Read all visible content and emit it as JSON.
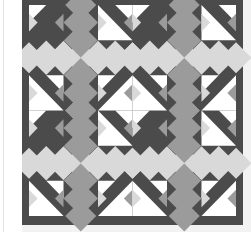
{
  "image": {
    "subject": "quilt-pattern",
    "description": "Geometric quilt with half-square triangles and on-point squares in gray tones"
  },
  "colors": {
    "dark": "#4b4b4b",
    "mid": "#9b9b9b",
    "light": "#d9d9d9",
    "white": "#ffffff",
    "border": "#4b4b4b",
    "binding": "#f2f2f2",
    "background": "#ffffff"
  },
  "quilt": {
    "x": 0,
    "y": 0,
    "outer_w": 221,
    "outer_h": 225,
    "border": 7,
    "grid_cols": 12,
    "grid_rows": 12,
    "block": [
      [
        "wl_tr",
        "d_tl",
        "mtop",
        "mtop2",
        "d_tr",
        "wr_tl"
      ],
      [
        "wd_bl",
        "w_tr",
        "mleft",
        "mright",
        "w_tl",
        "wd_br"
      ],
      [
        "lt_l",
        "lt_r2",
        "mbot",
        "mbot2",
        "lt_l2",
        "lt_r"
      ],
      [
        "lt_l3",
        "lt_r3",
        "mtop",
        "mtop2",
        "lt_l4",
        "lt_r4"
      ],
      [
        "wu_tl",
        "w_br",
        "mleft",
        "mright",
        "w_bl",
        "wu_tr"
      ],
      [
        "wl_br",
        "d_bl",
        "mbot",
        "mbot2",
        "d_br",
        "wr_bl"
      ]
    ]
  }
}
